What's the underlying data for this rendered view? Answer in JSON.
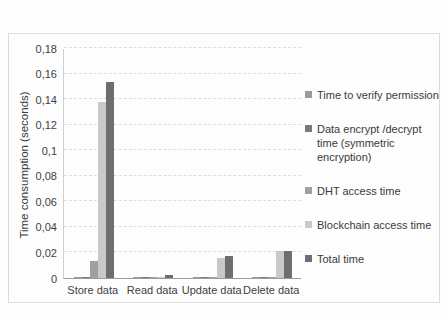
{
  "page": {
    "background_color": "#fefefe",
    "frame_border_color": "#dcdcdc",
    "text_color": "#3d3d3d"
  },
  "chart_data": {
    "type": "bar",
    "title": "",
    "xlabel": "",
    "ylabel": "Time consumption (seconds)",
    "categories": [
      "Store data",
      "Read data",
      "Update data",
      "Delete data"
    ],
    "series": [
      {
        "name": "Time to verify permission",
        "color": "#9b9b9b",
        "values": [
          0.001,
          0.0005,
          0.001,
          0.0005
        ]
      },
      {
        "name": "Data encrypt /decrypt time (symmetric encryption)",
        "color": "#7a7a7a",
        "values": [
          0.001,
          0.0005,
          0.0005,
          0.0005
        ]
      },
      {
        "name": "DHT access time",
        "color": "#a0a0a0",
        "values": [
          0.013,
          0.0005,
          0.0005,
          0.0005
        ]
      },
      {
        "name": "Blockchain access time",
        "color": "#c9c9c9",
        "values": [
          0.138,
          0.0005,
          0.016,
          0.021
        ]
      },
      {
        "name": "Total time",
        "color": "#6e6e6e",
        "values": [
          0.153,
          0.002,
          0.017,
          0.021
        ]
      }
    ],
    "ylim": [
      0,
      0.18
    ],
    "ytick_labels": [
      "0",
      "0,02",
      "0,04",
      "0,06",
      "0,08",
      "0,1",
      "0,12",
      "0,14",
      "0,16",
      "0,18"
    ],
    "grid": true,
    "gridline_color": "#dddddd",
    "legend_position": "right"
  }
}
